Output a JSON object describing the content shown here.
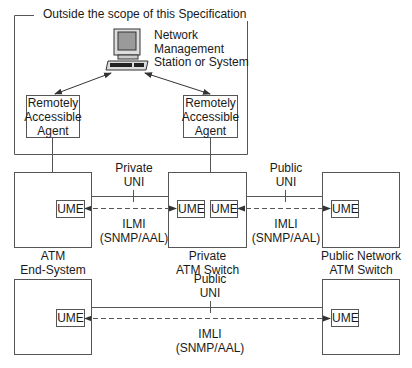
{
  "scope_box": {
    "title": "Outside the scope of this Specification"
  },
  "nms": {
    "icon": "computer-workstation-icon",
    "label_lines": [
      "Network",
      "Management",
      "Station or System"
    ]
  },
  "agents": [
    {
      "label_lines": [
        "Remotely",
        "Accessible",
        "Agent"
      ]
    },
    {
      "label_lines": [
        "Remotely",
        "Accessible",
        "Agent"
      ]
    }
  ],
  "nodes": {
    "end_system": {
      "label_lines": [
        "ATM",
        "End-System"
      ],
      "ume": "UME"
    },
    "private_switch": {
      "label_lines": [
        "Private",
        "ATM Switch"
      ],
      "ume_left": "UME",
      "ume_right": "UME"
    },
    "public_switch": {
      "label_lines": [
        "Public Network",
        "ATM Switch"
      ],
      "ume": "UME"
    },
    "bottom_end_system": {
      "ume": "UME"
    },
    "bottom_public_switch": {
      "ume": "UME"
    }
  },
  "links": [
    {
      "interface_lines": [
        "Private",
        "UNI"
      ],
      "protocol_lines": [
        "ILMI",
        "(SNMP/AAL)"
      ]
    },
    {
      "interface_lines": [
        "Public",
        "UNI"
      ],
      "protocol_lines": [
        "IMLI",
        "(SNMP/AAL)"
      ]
    },
    {
      "interface_lines": [
        "Public",
        "UNI"
      ],
      "protocol_lines": [
        "IMLI",
        "(SNMP/AAL)"
      ]
    }
  ],
  "colors": {
    "line": "#555555",
    "text": "#1a1a1a",
    "background": "#ffffff"
  }
}
